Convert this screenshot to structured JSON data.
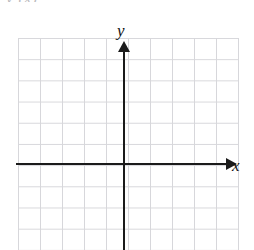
{
  "figure": {
    "cropped_header_text": "y  (x)",
    "background_color": "#ffffff"
  },
  "axes": {
    "x_label": "x",
    "y_label": "y",
    "axis_color": "#1b1b1b",
    "grid_color": "#d7d7db"
  },
  "chart_data": {
    "type": "scatter",
    "title": "",
    "xlabel": "x",
    "ylabel": "y",
    "series": [],
    "x": [],
    "values": [],
    "xlim": [
      -5,
      5
    ],
    "ylim": [
      -4,
      6
    ],
    "grid": true,
    "grid_cell_px": 22,
    "grid_columns": 10,
    "grid_rows": 10,
    "legend": "none",
    "annotations": []
  }
}
